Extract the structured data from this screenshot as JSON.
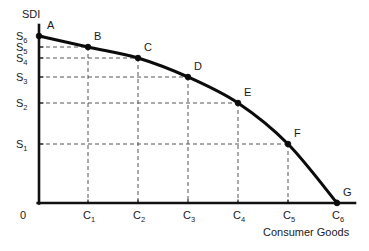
{
  "chart_data": {
    "type": "line",
    "title": "",
    "subtitle": "",
    "xlabel": "Consumer Goods",
    "ylabel": "SDI",
    "origin_label": "0",
    "grid": "dashed-guides-to-points",
    "legend": "none",
    "xlim": [
      0,
      6
    ],
    "ylim": [
      0,
      6
    ],
    "x_tick_labels": [
      "C",
      "C",
      "C",
      "C",
      "C",
      "C"
    ],
    "x_tick_subs": [
      "1",
      "2",
      "3",
      "4",
      "5",
      "6"
    ],
    "y_tick_labels": [
      "S",
      "S",
      "S",
      "S",
      "S",
      "S"
    ],
    "y_tick_subs": [
      "1",
      "2",
      "3",
      "4",
      "5",
      "6"
    ],
    "point_labels": [
      "A",
      "B",
      "C",
      "D",
      "E",
      "F",
      "G"
    ],
    "points": [
      {
        "label": "A",
        "x": 0,
        "y": 6,
        "px": 39,
        "py": 36
      },
      {
        "label": "B",
        "x": 1,
        "y": 5,
        "px": 88,
        "py": 47
      },
      {
        "label": "C",
        "x": 2,
        "y": 4,
        "px": 138,
        "py": 58
      },
      {
        "label": "D",
        "x": 3,
        "y": 3,
        "px": 188,
        "py": 77
      },
      {
        "label": "E",
        "x": 4,
        "y": 2,
        "px": 238,
        "py": 103
      },
      {
        "label": "F",
        "x": 5,
        "y": 1,
        "px": 288,
        "py": 144
      },
      {
        "label": "G",
        "x": 6,
        "y": 0,
        "px": 337,
        "py": 203
      }
    ],
    "curve_color": "#0b0b0b",
    "guide_color": "#555555",
    "axis_color": "#111111",
    "background_color": "#ffffff"
  }
}
